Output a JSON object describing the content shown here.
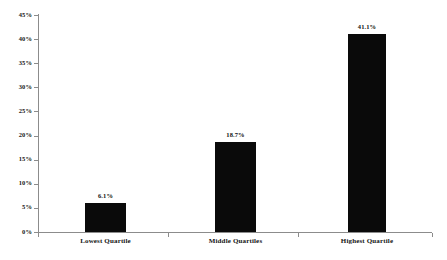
{
  "chart_data": {
    "type": "bar",
    "title": "",
    "subtitle": "",
    "xlabel": "",
    "ylabel": "",
    "categories": [
      "Lowest Quartile",
      "Middle Quartiles",
      "Highest Quartile"
    ],
    "values": [
      6.1,
      18.7,
      41.1
    ],
    "value_labels": [
      "6.1%",
      "18.7%",
      "41.1%"
    ],
    "ylim": [
      0,
      45
    ],
    "ytick_values": [
      0,
      5,
      10,
      15,
      20,
      25,
      30,
      35,
      40,
      45
    ],
    "ytick_labels": [
      "0%",
      "5%",
      "10%",
      "15%",
      "20%",
      "25%",
      "30%",
      "35%",
      "40%",
      "45%"
    ],
    "grid": false,
    "legend": false,
    "legend_position": "none",
    "bar_color": "#0a0a0a",
    "axis_color": "#8c8c8c",
    "background_color": "#ffffff",
    "units": "percent"
  },
  "axes": {
    "y": {
      "ticks": [
        {
          "label": "45%",
          "value": 45
        },
        {
          "label": "40%",
          "value": 40
        },
        {
          "label": "35%",
          "value": 35
        },
        {
          "label": "30%",
          "value": 30
        },
        {
          "label": "25%",
          "value": 25
        },
        {
          "label": "20%",
          "value": 20
        },
        {
          "label": "15%",
          "value": 15
        },
        {
          "label": "10%",
          "value": 10
        },
        {
          "label": "5%",
          "value": 5
        },
        {
          "label": "0%",
          "value": 0
        }
      ]
    }
  },
  "bars": [
    {
      "category": "Lowest Quartile",
      "value": 6.1,
      "label": "6.1%"
    },
    {
      "category": "Middle Quartiles",
      "value": 18.7,
      "label": "18.7%"
    },
    {
      "category": "Highest Quartile",
      "value": 41.1,
      "label": "41.1%"
    }
  ]
}
